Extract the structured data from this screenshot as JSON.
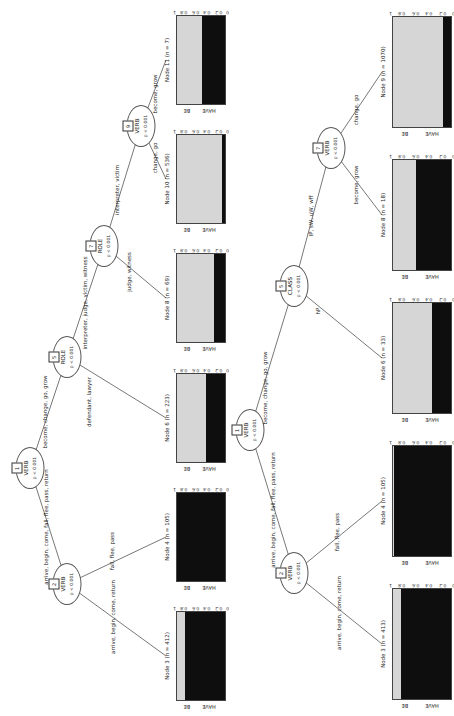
{
  "figure": {
    "colors": {
      "be_fill": "#d6d6d6",
      "have_fill": "#0e0e0e",
      "line": "#555555"
    }
  },
  "chart_data": [
    {
      "type": "decision-tree-stacked-bars",
      "orientation": "rotated-90",
      "response_levels": [
        "BE",
        "HAVE"
      ],
      "axis_ticks": [
        "1",
        "0.8",
        "0.6",
        "0.4",
        "0.2",
        "0"
      ],
      "inner_nodes": [
        {
          "id": "1",
          "name": "VERB",
          "stat": "p < 0.001"
        },
        {
          "id": "2",
          "name": "VERB",
          "stat": "p < 0.001"
        },
        {
          "id": "5",
          "name": "ROLE",
          "stat": "p < 0.001"
        },
        {
          "id": "7",
          "name": "ROLE",
          "stat": "p < 0.001"
        },
        {
          "id": "9",
          "name": "VERB",
          "stat": "p < 0.001"
        }
      ],
      "edge_labels": [
        "arrive, begin, come, fall, flee, pass, return",
        "become, change, go, grow",
        "arrive, begin, come, return",
        "fall, flee, pass",
        "defendant, lawyer",
        "interpreter, judge, victim, witness",
        "judge, witness",
        "interpreter, victim",
        "change, go",
        "become, grow"
      ],
      "terminals": [
        {
          "title": "Node 11 (n = 7)",
          "BE": 0.52,
          "HAVE": 0.48
        },
        {
          "title": "Node 10 (n = 536)",
          "BE": 0.94,
          "HAVE": 0.06
        },
        {
          "title": "Node 8 (n = 69)",
          "BE": 0.78,
          "HAVE": 0.22
        },
        {
          "title": "Node 6 (n = 223)",
          "BE": 0.6,
          "HAVE": 0.4
        },
        {
          "title": "Node 4 (n = 105)",
          "BE": 0.01,
          "HAVE": 0.99
        },
        {
          "title": "Node 3 (n = 412)",
          "BE": 0.16,
          "HAVE": 0.84
        }
      ]
    },
    {
      "type": "decision-tree-stacked-bars",
      "orientation": "rotated-90",
      "response_levels": [
        "BE",
        "HAVE"
      ],
      "axis_ticks": [
        "1",
        "0.8",
        "0.6",
        "0.4",
        "0.2",
        "0"
      ],
      "inner_nodes": [
        {
          "id": "1",
          "name": "VERB",
          "stat": "p < 0.001"
        },
        {
          "id": "2",
          "name": "VERB",
          "stat": "p < 0.001"
        },
        {
          "id": "5",
          "name": "CLASS",
          "stat": "p < 0.001"
        },
        {
          "id": "7",
          "name": "VERB",
          "stat": "p < 0.001"
        }
      ],
      "edge_labels": [
        "arrive, begin, come, fall, flee, pass, return",
        "become, change, go, grow",
        "arrive, begin, come, return",
        "fall, flee, pass",
        "hP",
        "IP, sW, uW, wff",
        "become, grow",
        "change, go"
      ],
      "terminals": [
        {
          "title": "Node 9 (n = 1070)",
          "BE": 0.86,
          "HAVE": 0.14
        },
        {
          "title": "Node 8 (n = 18)",
          "BE": 0.4,
          "HAVE": 0.6
        },
        {
          "title": "Node 6 (n = 33)",
          "BE": 0.68,
          "HAVE": 0.32
        },
        {
          "title": "Node 4 (n = 105)",
          "BE": 0.01,
          "HAVE": 0.99
        },
        {
          "title": "Node 3 (n = 413)",
          "BE": 0.13,
          "HAVE": 0.87
        }
      ]
    }
  ]
}
